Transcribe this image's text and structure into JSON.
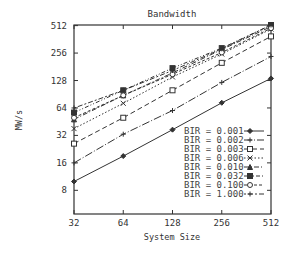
{
  "chart_data": {
    "type": "line",
    "title": "Bandwidth",
    "xlabel": "System Size",
    "ylabel": "MW/s",
    "xscale": "log2",
    "yscale": "log2",
    "x": [
      32,
      64,
      128,
      256,
      512
    ],
    "xticks": [
      "32",
      "64",
      "128",
      "256",
      "512"
    ],
    "yticks": [
      "8",
      "16",
      "32",
      "64",
      "128",
      "256",
      "512"
    ],
    "ytick_values": [
      8,
      16,
      32,
      64,
      128,
      256,
      512
    ],
    "xlim": [
      32,
      512
    ],
    "ylim": [
      4.4,
      520
    ],
    "grid": false,
    "legend_position": "bottom-right",
    "series": [
      {
        "name": "BIR = 0.001",
        "marker": "diamond-filled",
        "dash": "solid",
        "values": [
          10,
          19,
          37,
          73,
          135
        ]
      },
      {
        "name": "BIR = 0.002",
        "marker": "plus",
        "dash": "long-dash-dot",
        "values": [
          16,
          33,
          60,
          122,
          235
        ]
      },
      {
        "name": "BIR = 0.003",
        "marker": "square-open",
        "dash": "dash",
        "values": [
          26,
          50,
          100,
          200,
          390
        ]
      },
      {
        "name": "BIR = 0.006",
        "marker": "x",
        "dash": "dot",
        "values": [
          38,
          72,
          140,
          250,
          470
        ]
      },
      {
        "name": "BIR = 0.010",
        "marker": "triangle-filled",
        "dash": "dash-dot",
        "values": [
          48,
          88,
          155,
          280,
          500
        ]
      },
      {
        "name": "BIR = 0.032",
        "marker": "square-filled",
        "dash": "dash-dot-dot",
        "values": [
          57,
          100,
          175,
          290,
          520
        ]
      },
      {
        "name": "BIR = 0.100",
        "marker": "circle-open",
        "dash": "short-dash",
        "values": [
          50,
          88,
          150,
          260,
          480
        ]
      },
      {
        "name": "BIR = 1.000",
        "marker": "plus",
        "dash": "dot-dash",
        "values": [
          64,
          100,
          165,
          285,
          520
        ]
      }
    ]
  }
}
